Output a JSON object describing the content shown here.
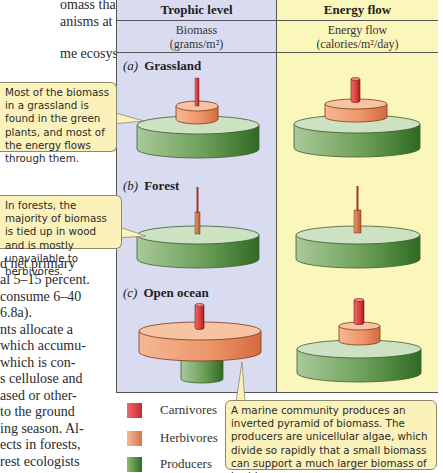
{
  "body_text": {
    "lines_top": [
      "omass that is",
      "anisms at the",
      "me ecosystem"
    ],
    "lines_bottom": [
      "d net primary",
      "al 5–15 percent.",
      "consume 6–40",
      "6.8a).",
      "nts allocate a",
      "which accumu-",
      "which is con-",
      "s cellulose and",
      "ased or other-",
      "to the ground",
      "ing season. Al-",
      "ects in forests,",
      "rest ecologists"
    ]
  },
  "table": {
    "columns": [
      {
        "header": "Trophic level",
        "subheader_line1": "Biomass",
        "subheader_line2": "(grams/m²)"
      },
      {
        "header": "Energy flow",
        "subheader_line1": "Energy flow",
        "subheader_line2": "(calories/m²/day)"
      }
    ],
    "sections": [
      {
        "letter": "(a)",
        "name": "Grassland"
      },
      {
        "letter": "(b)",
        "name": "Forest"
      },
      {
        "letter": "(c)",
        "name": "Open ocean"
      }
    ],
    "colors": {
      "biomass_bg": "#d9dbf1",
      "energy_bg": "#fbf6b9",
      "carnivores": "#d93b3b",
      "herbivores": "#ec9468",
      "producers": "#5f9a4c"
    }
  },
  "callouts": [
    {
      "text": "Most of the biomass in a grassland is found in the green plants, and most of the energy flows through them."
    },
    {
      "text": "In forests, the majority of biomass is tied up in wood and is mostly unavailable to herbivores."
    },
    {
      "text": "A marine community produces an inverted pyramid of biomass. The producers are unicellular algae, which divide so rapidly that a small biomass can support a much larger biomass of herbivores."
    }
  ],
  "legend": [
    {
      "label": "Carnivores",
      "color": "#d93b3b"
    },
    {
      "label": "Herbivores",
      "color": "#ec9468"
    },
    {
      "label": "Producers",
      "color": "#5f9a4c"
    }
  ]
}
